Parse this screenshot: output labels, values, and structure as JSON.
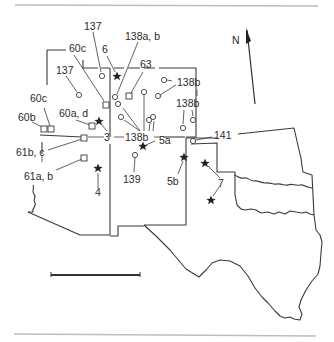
{
  "figure": {
    "type": "site location map",
    "region": "Southwestern United States (Arizona, New Mexico, Colorado/Utah corner, Oklahoma, Texas)",
    "north_arrow_label": "N",
    "scale_bar": true
  },
  "legend_symbols": {
    "circle": "site-circle",
    "square": "site-square",
    "star": "site-star"
  },
  "labels": [
    {
      "id": "l137a",
      "text": "137"
    },
    {
      "id": "l6",
      "text": "6"
    },
    {
      "id": "l138ab",
      "text": "138a, b"
    },
    {
      "id": "l60c_top",
      "text": "60c"
    },
    {
      "id": "l63",
      "text": "63"
    },
    {
      "id": "l137b",
      "text": "137"
    },
    {
      "id": "l138b_ne",
      "text": "138b"
    },
    {
      "id": "l60c_left",
      "text": "60c"
    },
    {
      "id": "l138b_e",
      "text": "138b"
    },
    {
      "id": "l60ad",
      "text": "60a, d"
    },
    {
      "id": "l60b",
      "text": "60b"
    },
    {
      "id": "l3",
      "text": "3"
    },
    {
      "id": "l138b_c",
      "text": "138b"
    },
    {
      "id": "l5a",
      "text": "5a"
    },
    {
      "id": "l141",
      "text": "141"
    },
    {
      "id": "l61bc",
      "text": "61b, c"
    },
    {
      "id": "l61ab",
      "text": "61a, b"
    },
    {
      "id": "l139",
      "text": "139"
    },
    {
      "id": "l5b",
      "text": "5b"
    },
    {
      "id": "l4",
      "text": "4"
    },
    {
      "id": "l7",
      "text": "7"
    }
  ],
  "sites": {
    "circles": [
      {
        "label": "137",
        "x": 102,
        "y": 76
      },
      {
        "label": "137",
        "x": 79,
        "y": 95
      },
      {
        "label": "138a, b",
        "x": 115,
        "y": 97
      },
      {
        "label": "138a, b",
        "x": 118,
        "y": 104
      },
      {
        "label": "138b",
        "x": 121,
        "y": 117
      },
      {
        "label": "138b",
        "x": 144,
        "y": 92
      },
      {
        "label": "138b",
        "x": 149,
        "y": 119
      },
      {
        "label": "138b",
        "x": 153,
        "y": 117
      },
      {
        "label": "138b",
        "x": 159,
        "y": 96
      },
      {
        "label": "138b",
        "x": 164,
        "y": 80
      },
      {
        "label": "138b",
        "x": 183,
        "y": 128
      },
      {
        "label": "138b",
        "x": 193,
        "y": 120
      },
      {
        "label": "141",
        "x": 193,
        "y": 140
      },
      {
        "label": "139",
        "x": 135,
        "y": 154
      }
    ],
    "squares": [
      {
        "label": "60c",
        "x": 106,
        "y": 105
      },
      {
        "label": "63",
        "x": 129,
        "y": 96
      },
      {
        "label": "60b",
        "x": 44,
        "y": 129
      },
      {
        "label": "60c",
        "x": 51,
        "y": 129
      },
      {
        "label": "60a, d",
        "x": 92,
        "y": 126
      },
      {
        "label": "61b, c",
        "x": 84,
        "y": 138
      },
      {
        "label": "61a, b",
        "x": 84,
        "y": 158
      }
    ],
    "stars": [
      {
        "label": "6",
        "x": 117,
        "y": 76
      },
      {
        "label": "60a, d",
        "x": 99,
        "y": 121
      },
      {
        "label": "5a",
        "x": 143,
        "y": 146
      },
      {
        "label": "4",
        "x": 98,
        "y": 168
      },
      {
        "label": "5b",
        "x": 184,
        "y": 157
      },
      {
        "label": "7",
        "x": 205,
        "y": 163
      },
      {
        "label": "7",
        "x": 211,
        "y": 200
      }
    ]
  }
}
